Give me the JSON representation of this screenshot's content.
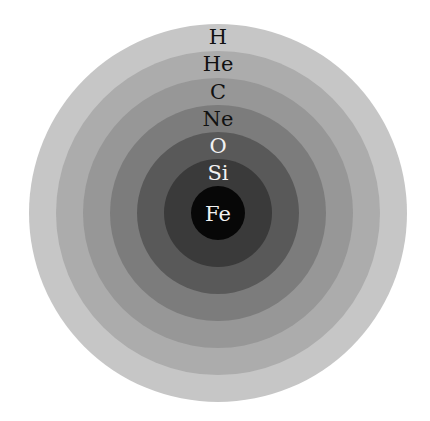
{
  "diagram": {
    "center": {
      "x": 218,
      "y": 213
    },
    "layers": [
      {
        "element": "H",
        "radius": 189,
        "color": "#c6c6c6",
        "label_color": "#111111",
        "label_y": 44
      },
      {
        "element": "He",
        "radius": 162,
        "color": "#acacac",
        "label_color": "#111111",
        "label_y": 71
      },
      {
        "element": "C",
        "radius": 135,
        "color": "#979797",
        "label_color": "#111111",
        "label_y": 99
      },
      {
        "element": "Ne",
        "radius": 108,
        "color": "#7c7c7c",
        "label_color": "#111111",
        "label_y": 126
      },
      {
        "element": "O",
        "radius": 81,
        "color": "#595959",
        "label_color": "#f2f2f2",
        "label_y": 153
      },
      {
        "element": "Si",
        "radius": 54,
        "color": "#3a3a3a",
        "label_color": "#f2f2f2",
        "label_y": 180
      },
      {
        "element": "Fe",
        "radius": 27,
        "color": "#070707",
        "label_color": "#f2f2f2",
        "label_y": 221
      }
    ]
  }
}
